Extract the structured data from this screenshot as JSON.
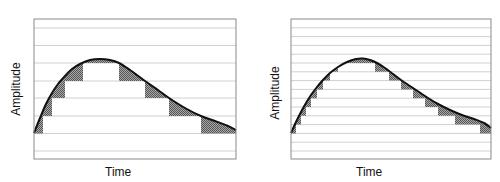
{
  "chart_data": [
    {
      "type": "line",
      "title": "Coarse quantization (large step size)",
      "xlabel": "Time",
      "ylabel": "Amplitude",
      "grid": true,
      "quantization_levels": 8,
      "frame": {
        "x": 34,
        "y": 19,
        "w": 202,
        "h": 140
      },
      "gridlines_y": [
        28,
        45.5,
        63,
        81,
        98,
        116,
        133.5,
        151
      ],
      "curve": [
        [
          34,
          133
        ],
        [
          40,
          118
        ],
        [
          46,
          104
        ],
        [
          52,
          93
        ],
        [
          58,
          84
        ],
        [
          65,
          76
        ],
        [
          72,
          69
        ],
        [
          80,
          64
        ],
        [
          90,
          60
        ],
        [
          100,
          59
        ],
        [
          110,
          60
        ],
        [
          119,
          63
        ],
        [
          130,
          70
        ],
        [
          145,
          81
        ],
        [
          158,
          90
        ],
        [
          169,
          98
        ],
        [
          185,
          108
        ],
        [
          201,
          116
        ],
        [
          215,
          121
        ],
        [
          228,
          126
        ],
        [
          236,
          130
        ]
      ],
      "steps": [
        {
          "x0": 34,
          "x1": 43,
          "level": 133.5
        },
        {
          "x0": 43,
          "x1": 52,
          "level": 116
        },
        {
          "x0": 52,
          "x1": 65,
          "level": 98
        },
        {
          "x0": 65,
          "x1": 83,
          "level": 81
        },
        {
          "x0": 83,
          "x1": 119,
          "level": 63
        },
        {
          "x0": 119,
          "x1": 145,
          "level": 81
        },
        {
          "x0": 145,
          "x1": 169,
          "level": 98
        },
        {
          "x0": 169,
          "x1": 201,
          "level": 116
        },
        {
          "x0": 201,
          "x1": 236,
          "level": 133.5
        }
      ]
    },
    {
      "type": "line",
      "title": "Fine quantization (small step size)",
      "xlabel": "Time",
      "ylabel": "Amplitude",
      "grid": true,
      "quantization_levels": 16,
      "frame": {
        "x": 291,
        "y": 19,
        "w": 200,
        "h": 140
      },
      "gridlines_y": [
        27.8,
        36.6,
        45.4,
        54.2,
        63,
        71.8,
        80.6,
        89.4,
        98.2,
        107,
        115.8,
        124.6,
        133.4,
        142.2,
        151
      ],
      "curve": [
        [
          291,
          133
        ],
        [
          296,
          122
        ],
        [
          301,
          112
        ],
        [
          306,
          103
        ],
        [
          311,
          95
        ],
        [
          317,
          87
        ],
        [
          323,
          80
        ],
        [
          330,
          73
        ],
        [
          338,
          67
        ],
        [
          347,
          62
        ],
        [
          356,
          59
        ],
        [
          363,
          58.5
        ],
        [
          370,
          60
        ],
        [
          377,
          63
        ],
        [
          385,
          68
        ],
        [
          393,
          74
        ],
        [
          401,
          80
        ],
        [
          410,
          86
        ],
        [
          419,
          92
        ],
        [
          428,
          98
        ],
        [
          438,
          104
        ],
        [
          450,
          110
        ],
        [
          462,
          115
        ],
        [
          474,
          119
        ],
        [
          484,
          123
        ],
        [
          491,
          128
        ]
      ],
      "steps": [
        {
          "x0": 291,
          "x1": 296,
          "level": 133.4
        },
        {
          "x0": 296,
          "x1": 301,
          "level": 124.6
        },
        {
          "x0": 301,
          "x1": 306,
          "level": 115.8
        },
        {
          "x0": 306,
          "x1": 311,
          "level": 107
        },
        {
          "x0": 311,
          "x1": 317,
          "level": 98.2
        },
        {
          "x0": 317,
          "x1": 323,
          "level": 89.4
        },
        {
          "x0": 323,
          "x1": 330,
          "level": 80.6
        },
        {
          "x0": 330,
          "x1": 338,
          "level": 71.8
        },
        {
          "x0": 338,
          "x1": 350,
          "level": 63
        },
        {
          "x0": 350,
          "x1": 375,
          "level": 63
        },
        {
          "x0": 375,
          "x1": 389,
          "level": 71.8
        },
        {
          "x0": 389,
          "x1": 401,
          "level": 80.6
        },
        {
          "x0": 401,
          "x1": 413,
          "level": 89.4
        },
        {
          "x0": 413,
          "x1": 425,
          "level": 98.2
        },
        {
          "x0": 425,
          "x1": 438,
          "level": 107
        },
        {
          "x0": 438,
          "x1": 455,
          "level": 115.8
        },
        {
          "x0": 455,
          "x1": 480,
          "level": 124.6
        },
        {
          "x0": 480,
          "x1": 491,
          "level": 133.4
        }
      ]
    }
  ],
  "panels": {
    "left": {
      "ylabel": "Amplitude",
      "xlabel": "Time"
    },
    "right": {
      "ylabel": "Amplitude",
      "xlabel": "Time"
    }
  },
  "colors": {
    "frame": "#8a8a8a",
    "grid": "#d0d0d0",
    "curve": "#111111",
    "error_fill": "#7a7a7a"
  }
}
